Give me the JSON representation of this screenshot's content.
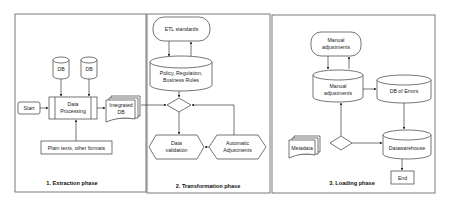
{
  "diagram": {
    "phases": [
      {
        "caption": "1. Extraction phase",
        "nodes": {
          "db1": "DB",
          "db2": "DB",
          "start": "Start",
          "processing_line1": "Data",
          "processing_line2": "Processing",
          "integrated_line1": "Integrated",
          "integrated_line2": "DB",
          "plain_texts": "Plain texts, other formats"
        }
      },
      {
        "caption": "2. Transformation phase",
        "nodes": {
          "etl_standards": "ETL standards",
          "policy_line1": "Policy, Regulation,",
          "policy_line2": "Business Rules",
          "validation_line1": "Data",
          "validation_line2": "validation",
          "auto_line1": "Automatic",
          "auto_line2": "Adjustments"
        }
      },
      {
        "caption": "3. Loading phase",
        "nodes": {
          "manual_top_line1": "Manual",
          "manual_top_line2": "adjustments",
          "manual_db_line1": "Manual",
          "manual_db_line2": "adjustments",
          "db_errors": "DB of Errors",
          "metadata": "Metadata",
          "datawarehouse": "Datawarehouse",
          "end": "End"
        }
      }
    ],
    "colors": {
      "stroke": "#3a3a3a",
      "panel_border": "#6a6a6a",
      "background": "#ffffff"
    }
  }
}
